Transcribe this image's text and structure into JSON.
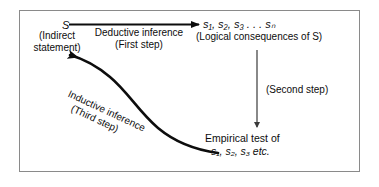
{
  "diagram": {
    "border_color": "#8a8a8a",
    "ink_color": "#0d0d0d",
    "background": "#ffffff",
    "nodes": {
      "start": {
        "symbol": "S",
        "qualifier_line1": "(Indirect",
        "qualifier_line2": "statement)"
      },
      "consequences": {
        "symbols": "s₁, s₂, s₃ . . . sₙ",
        "caption": "(Logical consequences of S)"
      },
      "empirical": {
        "line1": "Empirical test of",
        "line2": "s₁, s₂, s₃ etc."
      }
    },
    "edges": {
      "deductive": {
        "label_line1": "Deductive inference",
        "label_line2": "(First step)",
        "icon": "right-arrow-icon"
      },
      "second": {
        "label": "(Second step)",
        "icon": "down-arrow-icon"
      },
      "inductive": {
        "label_line1": "Inductive inference",
        "label_line2": "(Third step)",
        "icon": "curved-arrow-icon"
      }
    }
  }
}
